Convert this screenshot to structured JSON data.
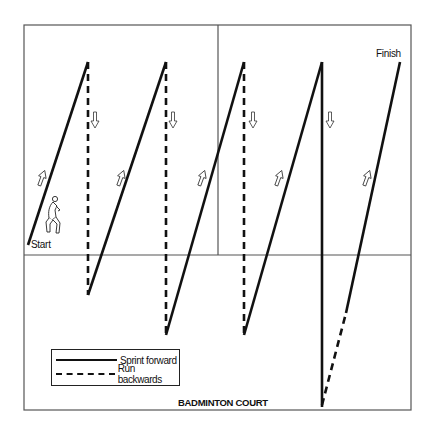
{
  "court": {
    "label": "BADMINTON COURT",
    "border": {
      "x1": 24,
      "y1": 25,
      "x2": 411,
      "y2": 410
    },
    "center_vertical": {
      "x": 218,
      "y1": 25,
      "y2": 255
    },
    "horizontal_line": {
      "y": 255
    },
    "line_color": "#555555"
  },
  "markers": {
    "start": "Start",
    "finish": "Finish"
  },
  "legend": {
    "items": [
      {
        "label": "Sprint forward",
        "style": "solid"
      },
      {
        "label": "Run backwards",
        "style": "dashed"
      }
    ]
  },
  "path": {
    "stroke_color": "#111111",
    "segments": [
      {
        "type": "sprint",
        "from": [
          28,
          245
        ],
        "to": [
          88,
          62
        ]
      },
      {
        "type": "backwards",
        "from": [
          88,
          62
        ],
        "to": [
          88,
          295
        ]
      },
      {
        "type": "sprint",
        "from": [
          88,
          295
        ],
        "to": [
          166,
          62
        ]
      },
      {
        "type": "backwards",
        "from": [
          166,
          62
        ],
        "to": [
          166,
          335
        ]
      },
      {
        "type": "sprint",
        "from": [
          166,
          335
        ],
        "to": [
          244,
          62
        ]
      },
      {
        "type": "backwards",
        "from": [
          244,
          62
        ],
        "to": [
          244,
          335
        ]
      },
      {
        "type": "sprint",
        "from": [
          244,
          335
        ],
        "to": [
          322,
          62
        ]
      },
      {
        "type": "sprint",
        "from": [
          322,
          62
        ],
        "to": [
          322,
          407
        ]
      },
      {
        "type": "backwards",
        "from": [
          322,
          405
        ],
        "to": [
          346,
          313
        ]
      },
      {
        "type": "sprint",
        "from": [
          346,
          313
        ],
        "to": [
          400,
          62
        ]
      }
    ]
  },
  "direction_arrows": [
    {
      "dir": "up",
      "x": 42,
      "y": 178
    },
    {
      "dir": "down",
      "x": 95,
      "y": 120
    },
    {
      "dir": "up",
      "x": 121,
      "y": 178
    },
    {
      "dir": "down",
      "x": 173,
      "y": 120
    },
    {
      "dir": "up",
      "x": 202,
      "y": 178
    },
    {
      "dir": "down",
      "x": 253,
      "y": 120
    },
    {
      "dir": "up",
      "x": 279,
      "y": 178
    },
    {
      "dir": "down",
      "x": 330,
      "y": 120
    },
    {
      "dir": "up",
      "x": 367,
      "y": 178
    }
  ]
}
